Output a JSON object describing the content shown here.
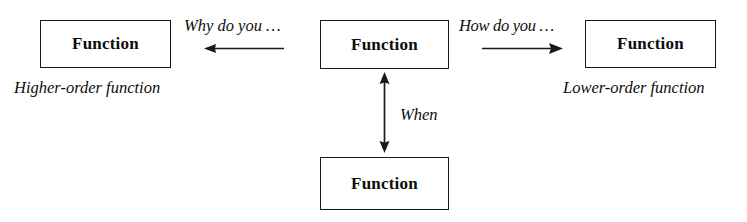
{
  "diagram": {
    "background_color": "#ffffff",
    "stroke_color": "#1a1a1a",
    "text_color": "#0d0d0d",
    "nodes": [
      {
        "id": "higher-order",
        "label": "Function",
        "caption": "Higher-order function"
      },
      {
        "id": "center",
        "label": "Function",
        "caption": ""
      },
      {
        "id": "lower-order",
        "label": "Function",
        "caption": "Lower-order function"
      },
      {
        "id": "bottom",
        "label": "Function",
        "caption": ""
      }
    ],
    "edges": [
      {
        "id": "center-to-higher",
        "label": "Why do you …",
        "direction": "left",
        "arrowheads": "single"
      },
      {
        "id": "center-to-lower",
        "label": "How do you …",
        "direction": "right",
        "arrowheads": "single"
      },
      {
        "id": "center-to-bottom",
        "label": "When",
        "direction": "vertical",
        "arrowheads": "double"
      }
    ]
  }
}
